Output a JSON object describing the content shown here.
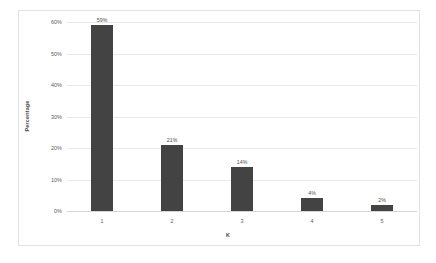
{
  "chart_data": {
    "type": "bar",
    "title": "",
    "subtitle": "",
    "xlabel": "K",
    "ylabel": "Percentage",
    "categories": [
      "1",
      "2",
      "3",
      "4",
      "5"
    ],
    "values": [
      59,
      21,
      14,
      4,
      2
    ],
    "data_labels": [
      "59%",
      "21%",
      "14%",
      "4%",
      "2%"
    ],
    "ylim": [
      0,
      60
    ],
    "ytick_values": [
      0,
      10,
      20,
      30,
      40,
      50,
      60
    ],
    "ytick_labels": [
      "0%",
      "10%",
      "20%",
      "30%",
      "40%",
      "50%",
      "60%"
    ],
    "grid": "horizontal",
    "legend": "none",
    "series": [
      {
        "name": "Percentage",
        "values": [
          59,
          21,
          14,
          4,
          2
        ],
        "color": "#434343"
      }
    ],
    "colors": {
      "bar": "#434343",
      "gridline": "#e8e8e8",
      "axis": "#d5d5d5",
      "frame": "#e2e2e2",
      "background": "#ffffff",
      "tick_text": "#5a5a5a",
      "axis_title_text": "#4a4a4a"
    }
  }
}
